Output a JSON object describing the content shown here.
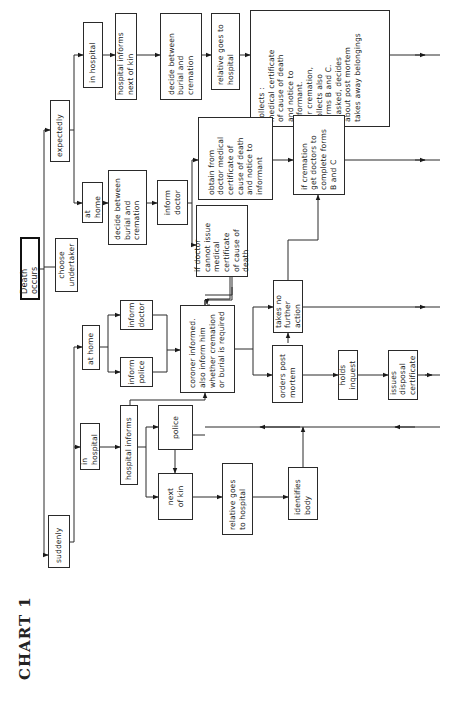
{
  "title": "CHART 1",
  "nodes": {
    "death_occurs": "Death occurs",
    "choose_undertaker": "choose\nundertaker",
    "expectedly": "expectedly",
    "suddenly": "suddenly",
    "exp_in_hospital": "in hospital",
    "exp_hosp_informs_kin": "hospital informs\nnext of kin",
    "exp_hosp_decide": "decide between\nburial and\ncremation",
    "exp_hosp_relative_goes": "relative goes to\nhospital",
    "exp_hosp_collects": "collects :\nmedical certificate\nof cause of death\nand notice to\ninformant.\nfor cremation,\ncollects also\nforms B and C.\nif asked, decides\nabout post mortem\ntakes away belongings",
    "exp_at_home": "at home",
    "exp_home_decide": "decide between\nburial and\ncremation",
    "exp_home_inform_doctor": "inform\ndoctor",
    "exp_home_obtain_cert": "obtain from\ndoctor medical\ncertificate of\ncause of death\nand notice to\ninformant",
    "exp_home_doctor_cannot": "if doctor\ncannot issue\nmedical certificate\nof cause of death",
    "if_cremation": "if cremation\nget doctors to\ncomplete forms\nB and C",
    "sud_at_home": "at home",
    "sud_inform_doctor": "inform\ndoctor",
    "sud_inform_police": "inform\npolice",
    "coroner_informed": "coroner informed.\nalso inform him\nwhether cremation\nor burial is required",
    "takes_no_further_action": "takes no\nfurther action",
    "orders_post_mortem": "orders post\nmortem",
    "holds_inquest": "holds inquest",
    "issues_disposal_certificate": "issues disposal\ncertificate",
    "sud_in_hospital": "in hospital",
    "sud_hospital_informs": "hospital informs",
    "police": "police",
    "next_of_kin": "next\nof  kin",
    "sud_relative_goes": "relative goes\nto hospital",
    "identifies_body": "identifies\nbody"
  },
  "colors": {
    "ink": "#1a1a1a",
    "background": "#ffffff"
  }
}
